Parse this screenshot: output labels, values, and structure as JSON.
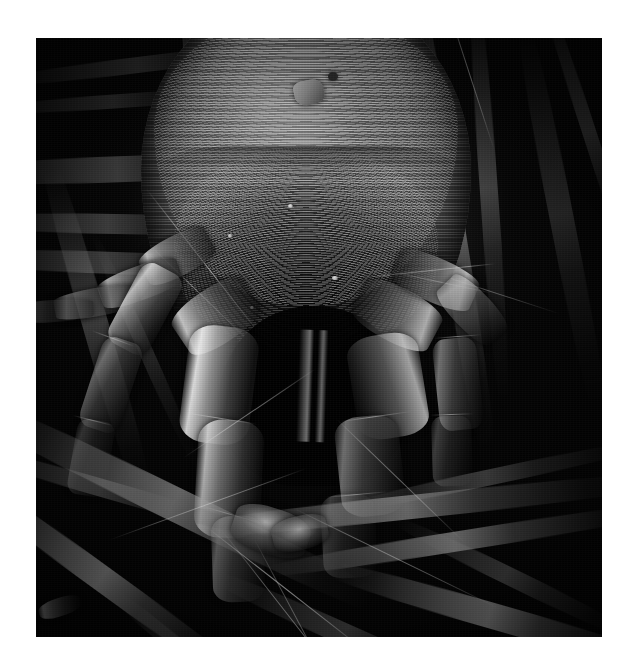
{
  "image": {
    "subject": "house dust mite",
    "technique": "scanning electron micrograph",
    "view": "dorsal-frontal close-up",
    "color_mode": "greyscale",
    "alt_text": "Black and white scanning electron micrograph of a house dust mite seen from the front and above, its striated dorsal shield filling the upper half of the frame, segmented legs and pedipalps reaching downward, surrounded by dark textile fibres.",
    "background_color": "#ffffff",
    "field_color": "#040404",
    "highlight_color": "#e6e6e6",
    "frame": {
      "left_px": 36,
      "top_px": 38,
      "width_px": 566,
      "height_px": 599
    }
  },
  "anatomy": {
    "idiosoma_label": "striated dorsal shield",
    "gnathosoma_label": "mouthparts cavity",
    "pedipalp_left_label": "left pedipalp",
    "pedipalp_right_label": "right pedipalp",
    "leg_labels": [
      "front left leg",
      "front right leg",
      "mid left leg",
      "mid right leg"
    ],
    "debris_label": "surface debris particle",
    "seta_label": "sensory seta"
  },
  "scene": {
    "fiber_label": "textile fibre",
    "fiber_count": 14
  }
}
